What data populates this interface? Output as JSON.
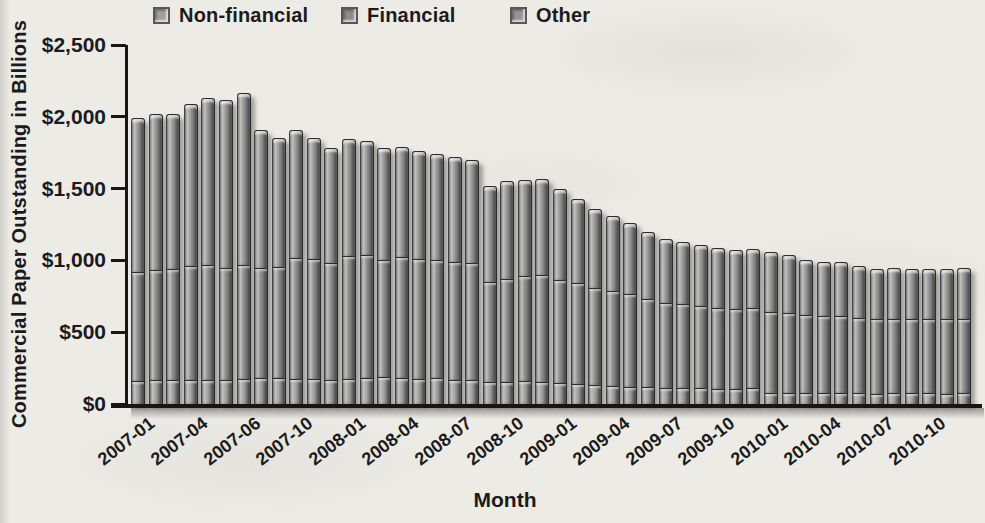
{
  "page": {
    "background": "#edebe6",
    "text_color": "#1b1b1b",
    "axis_color": "#161616"
  },
  "chart_data": {
    "type": "bar",
    "stacked": true,
    "title": "",
    "xlabel": "Month",
    "ylabel": "Commercial Paper Outstanding in Billions",
    "ylim": [
      0,
      2500
    ],
    "grid": false,
    "legend_position": "top",
    "ytick_values": [
      0,
      500,
      1000,
      1500,
      2000,
      2500
    ],
    "ytick_labels": [
      "$0",
      "$500",
      "$1,000",
      "$1,500",
      "$2,000",
      "$2,500"
    ],
    "categories": [
      "2007-01",
      "2007-02",
      "2007-03",
      "2007-04",
      "2007-05",
      "2007-06",
      "2007-07",
      "2007-08",
      "2007-09",
      "2007-10",
      "2007-11",
      "2007-12",
      "2008-01",
      "2008-02",
      "2008-03",
      "2008-04",
      "2008-05",
      "2008-06",
      "2008-07",
      "2008-08",
      "2008-09",
      "2008-10",
      "2008-11",
      "2008-12",
      "2009-01",
      "2009-02",
      "2009-03",
      "2009-04",
      "2009-05",
      "2009-06",
      "2009-07",
      "2009-08",
      "2009-09",
      "2009-10",
      "2009-11",
      "2009-12",
      "2010-01",
      "2010-02",
      "2010-03",
      "2010-04",
      "2010-05",
      "2010-06",
      "2010-07",
      "2010-08",
      "2010-09",
      "2010-10",
      "2010-11",
      "2010-12"
    ],
    "xticks": [
      {
        "category_index": 0,
        "label": "2007-01"
      },
      {
        "category_index": 3,
        "label": "2007-04"
      },
      {
        "category_index": 6,
        "label": "2007-06"
      },
      {
        "category_index": 9,
        "label": "2007-10"
      },
      {
        "category_index": 12,
        "label": "2008-01"
      },
      {
        "category_index": 15,
        "label": "2008-04"
      },
      {
        "category_index": 18,
        "label": "2008-07"
      },
      {
        "category_index": 21,
        "label": "2008-10"
      },
      {
        "category_index": 24,
        "label": "2009-01"
      },
      {
        "category_index": 27,
        "label": "2009-04"
      },
      {
        "category_index": 30,
        "label": "2009-07"
      },
      {
        "category_index": 33,
        "label": "2009-10"
      },
      {
        "category_index": 36,
        "label": "2010-01"
      },
      {
        "category_index": 39,
        "label": "2010-04"
      },
      {
        "category_index": 42,
        "label": "2010-07"
      },
      {
        "category_index": 45,
        "label": "2010-10"
      }
    ],
    "series": [
      {
        "name": "Non-financial",
        "color": "#a0a0a0",
        "values": [
          160,
          165,
          165,
          170,
          170,
          170,
          175,
          180,
          180,
          175,
          175,
          170,
          175,
          180,
          185,
          180,
          175,
          180,
          170,
          165,
          155,
          150,
          160,
          155,
          145,
          140,
          130,
          125,
          120,
          120,
          110,
          110,
          110,
          105,
          105,
          110,
          80,
          80,
          75,
          75,
          80,
          75,
          70,
          75,
          75,
          75,
          70,
          75
        ]
      },
      {
        "name": "Financial",
        "color": "#8b8b8b",
        "values": [
          760,
          770,
          775,
          790,
          800,
          780,
          795,
          770,
          775,
          845,
          835,
          810,
          855,
          855,
          815,
          845,
          835,
          820,
          820,
          815,
          695,
          720,
          730,
          745,
          720,
          700,
          680,
          665,
          645,
          610,
          590,
          585,
          575,
          565,
          555,
          560,
          560,
          555,
          545,
          540,
          535,
          525,
          520,
          520,
          515,
          515,
          520,
          520
        ]
      },
      {
        "name": "Other",
        "color": "#949494",
        "values": [
          1070,
          1085,
          1080,
          1130,
          1160,
          1170,
          1195,
          960,
          900,
          885,
          840,
          800,
          815,
          795,
          780,
          765,
          750,
          740,
          730,
          720,
          670,
          680,
          670,
          670,
          635,
          590,
          550,
          520,
          495,
          470,
          450,
          435,
          425,
          420,
          410,
          410,
          420,
          405,
          380,
          375,
          375,
          360,
          350,
          355,
          350,
          350,
          350,
          355
        ]
      }
    ]
  }
}
